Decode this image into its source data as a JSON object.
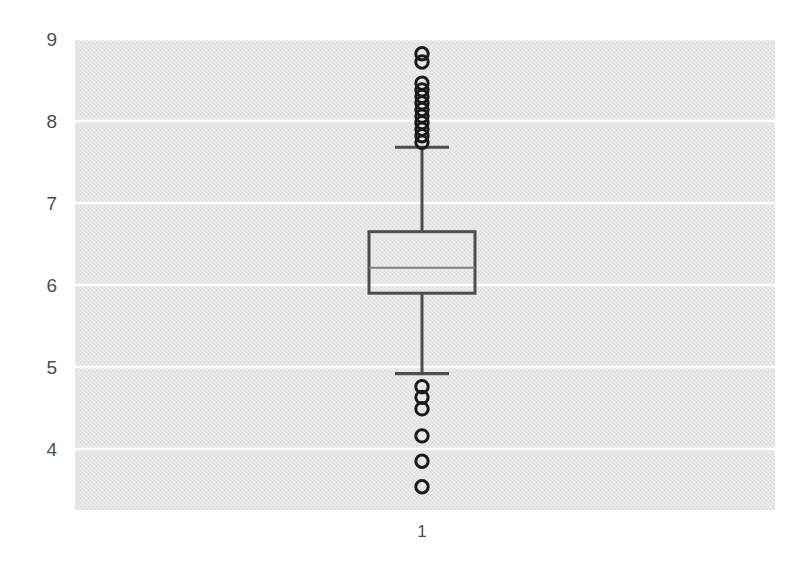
{
  "chart_data": {
    "type": "box",
    "title": "",
    "xlabel": "",
    "ylabel": "",
    "categories": [
      "1"
    ],
    "xtick_labels": [
      "1"
    ],
    "ytick_labels": [
      "4",
      "5",
      "6",
      "7",
      "8",
      "9"
    ],
    "ytick_values": [
      4,
      5,
      6,
      7,
      8,
      9
    ],
    "ylim": [
      3.35,
      8.97
    ],
    "grid": "horizontal",
    "grid_color": "#ffffff",
    "plot_background": "#e6e6e6",
    "figure_background": "#ffffff",
    "legend": "none",
    "box_color": "#4d4d4d",
    "median_color": "#808080",
    "whisker_color": "#4d4d4d",
    "outlier_color": "#1a1a1a",
    "boxes": [
      {
        "name": "1",
        "x_center": 1,
        "q1": 5.9,
        "median": 6.21,
        "q3": 6.65,
        "whisker_low": 4.92,
        "whisker_high": 7.68,
        "outliers_high": [
          8.82,
          8.72,
          8.46,
          8.38,
          8.3,
          8.22,
          8.14,
          8.06,
          7.98,
          7.9,
          7.82,
          7.74
        ],
        "outliers_low": [
          4.76,
          4.63,
          4.49,
          4.16,
          3.85,
          3.54
        ]
      }
    ]
  },
  "axes": {
    "y_axis_name": "y-axis",
    "x_axis_name": "x-axis"
  }
}
